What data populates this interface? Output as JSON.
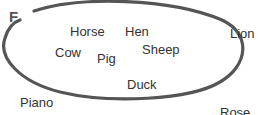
{
  "set": {
    "label": "F",
    "members": [
      "Horse",
      "Hen",
      "Cow",
      "Pig",
      "Sheep",
      "Duck"
    ]
  },
  "outside": [
    "Lion",
    "Piano",
    "Rose"
  ],
  "colors": {
    "loop": "#555555",
    "text": "#333333"
  }
}
